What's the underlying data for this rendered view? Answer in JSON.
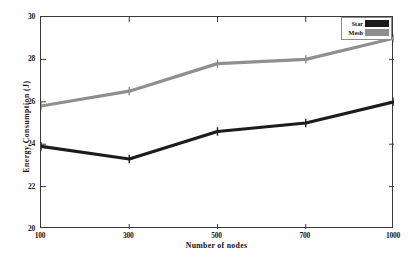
{
  "chart_data": {
    "type": "line",
    "title": "",
    "xlabel": "Number of nodes",
    "ylabel": "Energy Consumption (J)",
    "categories": [
      "100",
      "300",
      "500",
      "700",
      "1000"
    ],
    "x": [
      100,
      300,
      500,
      700,
      1000
    ],
    "series": [
      {
        "name": "Star",
        "color": "#1c1c1c",
        "values": [
          23.9,
          23.3,
          24.6,
          25.0,
          26.0
        ]
      },
      {
        "name": "Mesh",
        "color": "#8f8f8f",
        "values": [
          25.8,
          26.5,
          27.8,
          28.0,
          29.0
        ]
      }
    ],
    "ylim": [
      20,
      30
    ],
    "yticks": [
      20,
      22,
      24,
      26,
      28,
      30
    ],
    "ytick_labels": [
      "20",
      "22",
      "24",
      "26",
      "28",
      "30"
    ],
    "xtick_labels": [
      "100",
      "300",
      "500",
      "700",
      "1000"
    ],
    "grid": false,
    "legend_position": "top-right",
    "marker": "plus",
    "frame": true
  },
  "legend": {
    "entries": [
      {
        "label": "Star",
        "color": "#1c1c1c"
      },
      {
        "label": "Mesh",
        "color": "#8f8f8f"
      }
    ]
  },
  "axes": {
    "y_title": "Energy Consumption (J)",
    "x_title": "Number of nodes"
  }
}
